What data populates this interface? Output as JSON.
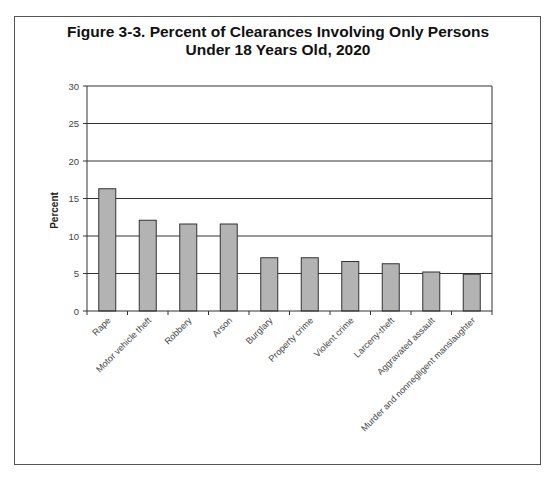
{
  "chart_data": {
    "type": "bar",
    "title": "Figure 3-3. Percent of Clearances Involving Only Persons Under 18 Years Old, 2020",
    "title_lines": [
      "Figure 3-3. Percent of Clearances Involving Only Persons",
      "Under 18 Years Old, 2020"
    ],
    "xlabel": "",
    "ylabel": "Percent",
    "ylim": [
      0,
      30
    ],
    "yticks": [
      0,
      5,
      10,
      15,
      20,
      25,
      30
    ],
    "grid": true,
    "legend": null,
    "categories": [
      "Rape",
      "Motor vehicle theft",
      "Robbery",
      "Arson",
      "Burglary",
      "Property crime",
      "Violent crime",
      "Larceny-theft",
      "Aggravated assault",
      "Murder and nonnegligent manslaughter"
    ],
    "values": [
      16.3,
      12.1,
      11.6,
      11.6,
      7.1,
      7.1,
      6.6,
      6.3,
      5.2,
      4.9
    ],
    "bar_color": "#b3b3b3"
  }
}
